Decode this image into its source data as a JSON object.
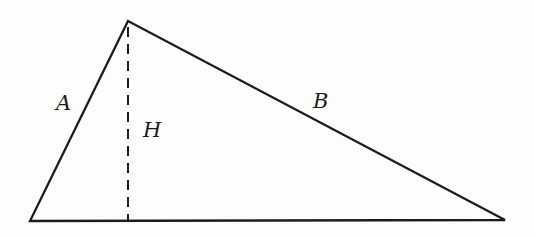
{
  "diagram": {
    "type": "triangle-with-altitude",
    "labels": {
      "left_side": "A",
      "right_side": "B",
      "altitude": "H"
    },
    "geometry": {
      "triangle_points": "128,21 30,221 505,220",
      "altitude_path": "M128,27 L128,220"
    },
    "style": {
      "stroke_color": "#1c1c1c",
      "background_color": "#fdfdfd",
      "altitude_dash_pattern": "10 7"
    }
  }
}
